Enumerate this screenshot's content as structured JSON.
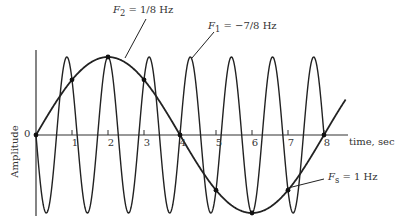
{
  "chart_data": {
    "type": "line",
    "title": "",
    "xlabel": "time, sec",
    "ylabel": "Amplitude",
    "xlim": [
      0,
      8.6
    ],
    "ylim": [
      -1,
      1
    ],
    "x_ticks": [
      "1",
      "2",
      "3",
      "4",
      "5",
      "6",
      "7",
      "8"
    ],
    "y_ticks": [
      "0"
    ],
    "grid": false,
    "series": [
      {
        "name": "F2 = 1/8 Hz",
        "function": "sin(2*pi*(1/8)*t)",
        "frequency_hz": 0.125,
        "t_range": [
          0,
          8.6
        ]
      },
      {
        "name": "F1 = -7/8 Hz",
        "function": "sin(2*pi*(-7/8)*t)",
        "frequency_hz": -0.875,
        "t_range": [
          0,
          8
        ]
      },
      {
        "name": "Fs = 1 Hz (sample points)",
        "t": [
          0,
          1,
          2,
          3,
          4,
          5,
          6,
          7,
          8
        ],
        "values": [
          0,
          0.707,
          1,
          0.707,
          0,
          -0.707,
          -1,
          -0.707,
          0
        ]
      }
    ],
    "annotations": [
      {
        "text_main": "F",
        "sub": "2",
        "rest": " = 1/8 Hz",
        "points_to": "F2 curve near t=2.5"
      },
      {
        "text_main": "F",
        "sub": "1",
        "rest": " = −7/8 Hz",
        "points_to": "F1 curve near t=3.8"
      },
      {
        "text_main": "F",
        "sub": "s",
        "rest": " = 1 Hz",
        "points_to": "sample point at t=7"
      }
    ]
  },
  "labels": {
    "f2": {
      "main": "F",
      "sub": "2",
      "rest": " = 1/8 Hz"
    },
    "f1": {
      "main": "F",
      "sub": "1",
      "rest": " = −7/8 Hz"
    },
    "fs": {
      "main": "F",
      "sub": "s",
      "rest": " = 1 Hz"
    },
    "xlabel": "time, sec",
    "ylabel": "Amplitude",
    "zero": "0",
    "ticks": [
      "1",
      "2",
      "3",
      "4",
      "5",
      "6",
      "7",
      "8"
    ]
  }
}
